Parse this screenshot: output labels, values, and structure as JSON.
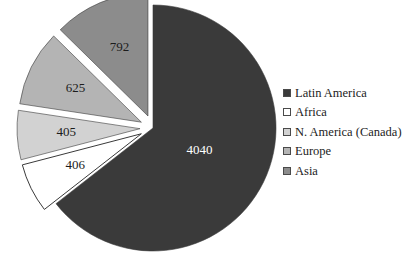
{
  "chart_data": {
    "type": "pie",
    "title": "",
    "categories": [
      "Latin America",
      "Africa",
      "N. America (Canada)",
      "Europe",
      "Asia"
    ],
    "values": [
      4040,
      406,
      405,
      625,
      792
    ],
    "data_labels": [
      "4040",
      "406",
      "405",
      "625",
      "792"
    ],
    "total": 6268,
    "colors": [
      "#3a3a3a",
      "#ffffff",
      "#d2d2d2",
      "#b4b4b4",
      "#8c8c8c"
    ],
    "label_text_colors": [
      "#ffffff",
      "#1c1c1c",
      "#1c1c1c",
      "#1c1c1c",
      "#1c1c1c"
    ],
    "exploded": [
      false,
      true,
      true,
      true,
      true
    ],
    "legend_position": "right",
    "grid": false,
    "xlabel": "",
    "ylabel": ""
  },
  "legend": {
    "items": [
      {
        "label": "Latin America",
        "color": "#3a3a3a"
      },
      {
        "label": "Africa",
        "color": "#ffffff"
      },
      {
        "label": "N. America (Canada)",
        "color": "#d2d2d2"
      },
      {
        "label": "Europe",
        "color": "#b4b4b4"
      },
      {
        "label": "Asia",
        "color": "#8c8c8c"
      }
    ]
  },
  "slices": {
    "latin_america": "4040",
    "africa": "406",
    "n_america": "405",
    "europe": "625",
    "asia": "792"
  }
}
